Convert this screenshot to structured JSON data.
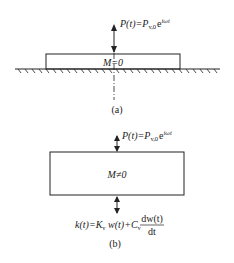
{
  "figure_a": {
    "force_label": {
      "main": "P(t)=P",
      "sub": "v,0",
      "exp_base": "e",
      "exp": "iωt"
    },
    "mass_label": "M=0",
    "caption": "(a)"
  },
  "figure_b": {
    "force_label": {
      "main": "P(t)=P",
      "sub": "v,0",
      "exp_base": "e",
      "exp": "iωt"
    },
    "mass_label": "M≠0",
    "reaction_label": {
      "lhs": "k(t)=K",
      "sub1": "v",
      "mid": " w(t)+C",
      "sub2": "v",
      "frac_num": "dw(t)",
      "frac_den": "dt"
    },
    "caption": "(b)"
  },
  "colors": {
    "line": "#222222",
    "background": "#ffffff"
  }
}
